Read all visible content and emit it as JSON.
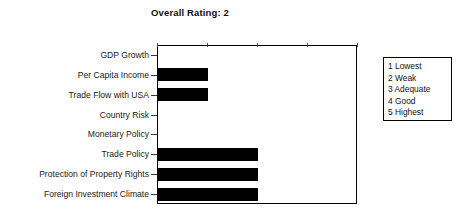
{
  "chart_data": {
    "type": "bar",
    "orientation": "horizontal",
    "title": "Overall Rating: 2",
    "xlabel": "",
    "ylabel": "",
    "xlim": [
      1,
      5
    ],
    "xticks": [
      1,
      2,
      3,
      4,
      5
    ],
    "xtick_labels": [
      "1",
      "2",
      "3",
      "4",
      "5"
    ],
    "axis_position": "top",
    "grid": false,
    "bar_color": "#000000",
    "categories": [
      "GDP Growth",
      "Per Capita Income",
      "Trade Flow with USA",
      "Country Risk",
      "Monetary Policy",
      "Trade Policy",
      "Protection of Property Rights",
      "Foreign Investment Climate"
    ],
    "values": [
      1,
      2,
      2,
      1,
      1,
      3,
      3,
      3
    ],
    "legend_position": "right-outside",
    "legend_entries": [
      "1 Lowest",
      "2 Weak",
      "3 Adequate",
      "4 Good",
      "5 Highest"
    ]
  }
}
